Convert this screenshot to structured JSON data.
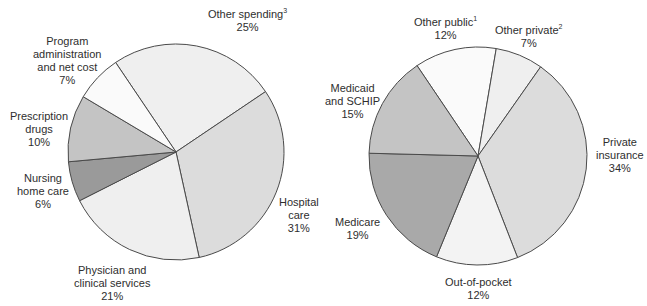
{
  "chart_data": [
    {
      "type": "pie",
      "title": "",
      "categories": [
        "Other spending",
        "Hospital care",
        "Physician and clinical services",
        "Nursing home care",
        "Prescription drugs",
        "Program administration and net cost"
      ],
      "values": [
        25,
        31,
        21,
        6,
        10,
        7
      ],
      "unit": "%",
      "footnotes": {
        "Other spending": "3"
      },
      "colors": [
        "#efefef",
        "#dcdcdc",
        "#efefef",
        "#9a9a9a",
        "#c4c4c4",
        "#fafafa"
      ],
      "labels": [
        {
          "lines": [
            "Other spending"
          ],
          "sup": "3",
          "pct": "25%"
        },
        {
          "lines": [
            "Hospital",
            "care"
          ],
          "sup": "",
          "pct": "31%"
        },
        {
          "lines": [
            "Physician and",
            "clinical services"
          ],
          "sup": "",
          "pct": "21%"
        },
        {
          "lines": [
            "Nursing",
            "home care"
          ],
          "sup": "",
          "pct": "6%"
        },
        {
          "lines": [
            "Prescription",
            "drugs"
          ],
          "sup": "",
          "pct": "10%"
        },
        {
          "lines": [
            "Program",
            "administration",
            "and net cost"
          ],
          "sup": "",
          "pct": "7%"
        }
      ]
    },
    {
      "type": "pie",
      "title": "",
      "categories": [
        "Other public",
        "Other private",
        "Private insurance",
        "Out-of-pocket",
        "Medicare",
        "Medicaid and SCHIP"
      ],
      "values": [
        12,
        7,
        34,
        12,
        19,
        15
      ],
      "unit": "%",
      "footnotes": {
        "Other public": "1",
        "Other private": "2"
      },
      "colors": [
        "#fafafa",
        "#efefef",
        "#dcdcdc",
        "#f3f3f3",
        "#a9a9a9",
        "#c4c4c4"
      ],
      "labels": [
        {
          "lines": [
            "Other public"
          ],
          "sup": "1",
          "pct": "12%"
        },
        {
          "lines": [
            "Other private"
          ],
          "sup": "2",
          "pct": "7%"
        },
        {
          "lines": [
            "Private",
            "insurance"
          ],
          "sup": "",
          "pct": "34%"
        },
        {
          "lines": [
            "Out-of-pocket"
          ],
          "sup": "",
          "pct": "12%"
        },
        {
          "lines": [
            "Medicare"
          ],
          "sup": "",
          "pct": "19%"
        },
        {
          "lines": [
            "Medicaid",
            "and SCHIP"
          ],
          "sup": "",
          "pct": "15%"
        }
      ]
    }
  ]
}
